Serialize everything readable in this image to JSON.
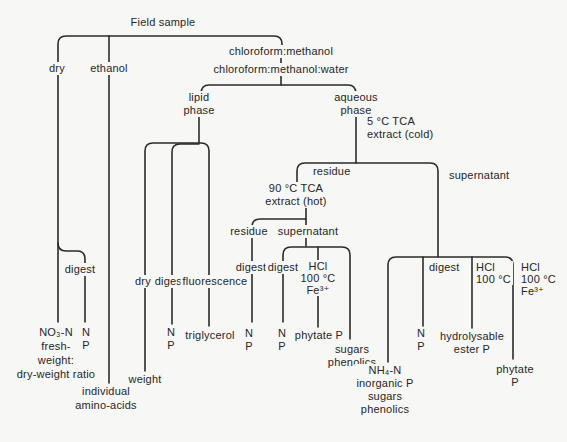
{
  "figure": {
    "root_label": "Field sample",
    "bg_color": "#f7f7f5",
    "line_color": "#2b2b2b",
    "branches": {
      "dry": {
        "label": "dry",
        "digest": {
          "label": "digest",
          "results": [
            "N",
            "P"
          ]
        },
        "results": [
          "NO₃-N",
          "fresh-",
          "weight:",
          "dry-weight ratio"
        ]
      },
      "ethanol": {
        "label": "ethanol",
        "results": [
          "individual",
          "amino-acids"
        ]
      },
      "chloroform": {
        "step1": "chloroform:methanol",
        "step2": "chloroform:methanol:water",
        "lipid": {
          "label": [
            "lipid",
            "phase"
          ],
          "dry": {
            "label": "dry",
            "result": "weight"
          },
          "digest": {
            "label": "digest",
            "results": [
              "N",
              "P"
            ]
          },
          "fluorescence": {
            "label": "fluorescence",
            "result": "triglycerol"
          }
        },
        "aqueous": {
          "label": [
            "aqueous",
            "phase"
          ],
          "treatment": [
            "5 °C TCA",
            "extract (cold)"
          ],
          "residue": {
            "label": "residue",
            "treatment": [
              "90 °C TCA",
              "extract (hot)"
            ],
            "residue": {
              "label": "residue",
              "digest": {
                "label": "digest",
                "results": [
                  "N",
                  "P"
                ]
              }
            },
            "supernatant": {
              "label": "supernatant",
              "digest": {
                "label": "digest",
                "results": [
                  "N",
                  "P"
                ]
              },
              "hcl": {
                "label": [
                  "HCl",
                  "100 °C",
                  "Fe³⁺"
                ],
                "result": "phytate P"
              },
              "direct": {
                "results": [
                  "sugars",
                  "phenolics"
                ]
              }
            }
          },
          "supernatant": {
            "label": "supernatant",
            "direct": {
              "results": [
                "NH₄-N",
                "inorganic P",
                "sugars",
                "phenolics"
              ]
            },
            "digest": {
              "label": "digest",
              "results": [
                "N",
                "P"
              ]
            },
            "hcl": {
              "label": [
                "HCl",
                "100 °C"
              ],
              "results": [
                "hydrolysable",
                "ester P"
              ]
            },
            "hcl_fe": {
              "label": [
                "HCl",
                "100 °C",
                "Fe³⁺"
              ],
              "result": "phytate P"
            }
          }
        }
      }
    }
  }
}
